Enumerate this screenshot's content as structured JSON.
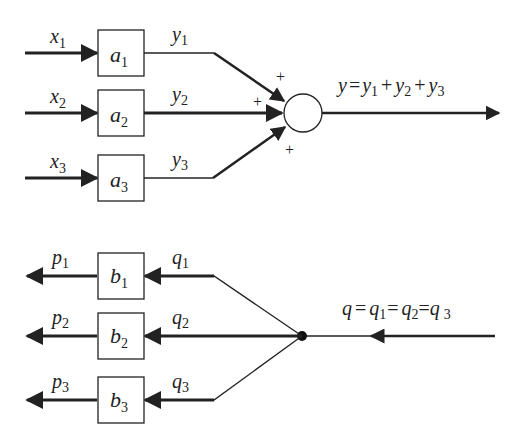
{
  "diagram": {
    "summing": {
      "inputs": [
        {
          "label": "x",
          "sub": "1",
          "block": "a",
          "block_sub": "1",
          "out": "y",
          "out_sub": "1",
          "sign": "+"
        },
        {
          "label": "x",
          "sub": "2",
          "block": "a",
          "block_sub": "2",
          "out": "y",
          "out_sub": "2",
          "sign": "+"
        },
        {
          "label": "x",
          "sub": "3",
          "block": "a",
          "block_sub": "3",
          "out": "y",
          "out_sub": "3",
          "sign": "+"
        }
      ],
      "output_equation": {
        "lhs": "y",
        "eq": "=",
        "terms": [
          "y",
          "1",
          "+",
          "y",
          "2",
          "+",
          "y",
          "3"
        ]
      }
    },
    "branching": {
      "outputs": [
        {
          "label": "p",
          "sub": "1",
          "block": "b",
          "block_sub": "1",
          "in": "q",
          "in_sub": "1"
        },
        {
          "label": "p",
          "sub": "2",
          "block": "b",
          "block_sub": "2",
          "in": "q",
          "in_sub": "2"
        },
        {
          "label": "p",
          "sub": "3",
          "block": "b",
          "block_sub": "3",
          "in": "q",
          "in_sub": "3"
        }
      ],
      "input_equation": {
        "lhs": "q",
        "eq1": "=",
        "t1": "q",
        "t1_sub": "1",
        "eq2": "=",
        "t2": "q",
        "t2_sub": "2",
        "eq3": "=",
        "t3": "q",
        "t3_sub": "3"
      }
    },
    "colors": {
      "stroke": "#222222",
      "background": "#ffffff"
    }
  }
}
